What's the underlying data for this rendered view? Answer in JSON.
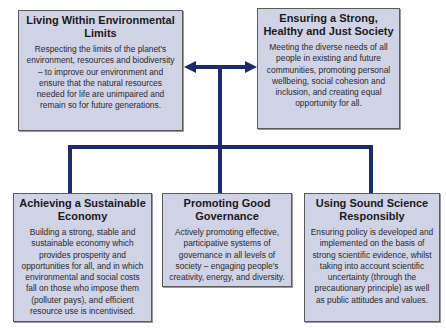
{
  "colors": {
    "box_fill": "#d0d2e6",
    "box_border": "#5a5a5a",
    "connector": "#1e2a6e",
    "background": "#ffffff"
  },
  "top_boxes": [
    {
      "title": "Living Within Environmental Limits",
      "body": "Respecting the limits of the planet's environment, resources and biodiversity – to improve our environment and ensure that the natural resources needed for life are unimpaired and remain so for future generations."
    },
    {
      "title": "Ensuring a Strong, Healthy and Just Society",
      "body": "Meeting the diverse needs of all people in existing and future communities, promoting personal wellbeing, social cohesion and inclusion, and creating equal opportunity for all."
    }
  ],
  "bottom_boxes": [
    {
      "title": "Achieving a Sustainable Economy",
      "body": "Building a strong, stable and sustainable economy which provides prosperity and opportunities for all, and in which environmental and social costs fall on those who impose them (polluter pays), and efficient resource use is incentivised."
    },
    {
      "title": "Promoting Good Governance",
      "body": "Actively promoting effective, participative systems of governance in all levels of society – engaging people's creativity, energy, and diversity."
    },
    {
      "title": "Using Sound Science Responsibly",
      "body": "Ensuring policy is developed and implemented on the basis of strong scientific evidence, whilst taking into account scientific uncertainty (through the precautionary principle) as well as public attitudes and values."
    }
  ],
  "connectors": {
    "top_arrow": "double-headed-arrow",
    "stem": "vertical-line",
    "bottom_branch": "horizontal-bar-with-three-drops"
  }
}
